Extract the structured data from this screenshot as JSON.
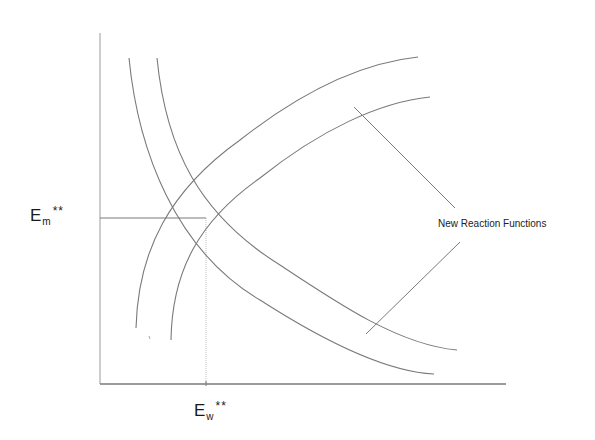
{
  "diagram": {
    "type": "reaction-function-shift",
    "colors": {
      "line": "#7a7a7a",
      "axis": "#8a8a8a",
      "guide": "#9a9a9a",
      "text": "#1a1a1a",
      "background": "#ffffff"
    },
    "labels": {
      "y_equilibrium": {
        "base": "E",
        "subscript": "m",
        "superscript": "**"
      },
      "x_equilibrium": {
        "base": "E",
        "subscript": "w",
        "superscript": "**"
      },
      "annotation": "New Reaction Functions"
    },
    "axes": {
      "origin": [
        100,
        384
      ],
      "y_axis_top": [
        100,
        33
      ],
      "x_axis_right": [
        506,
        384
      ]
    },
    "equilibrium_point": [
      206,
      218
    ],
    "curves": [
      {
        "name": "falling-reaction-function-outer",
        "path": "M129,58 C138,150 175,250 260,300 C330,345 390,372 434,374"
      },
      {
        "name": "falling-reaction-function-new",
        "path": "M157,58 C166,150 200,215 280,265 C340,305 400,345 457,350"
      },
      {
        "name": "rising-reaction-function-outer",
        "path": "M136,328 C138,250 170,190 240,140 C310,85 370,62 418,57"
      },
      {
        "name": "rising-reaction-function-new",
        "path": "M171,340 C172,270 200,220 260,178 C320,130 380,102 430,97"
      }
    ],
    "pointers": [
      {
        "name": "pointer-line-upper",
        "from": [
          354,
          107
        ],
        "to": [
          455,
          208
        ]
      },
      {
        "name": "pointer-line-lower",
        "from": [
          366,
          334
        ],
        "to": [
          460,
          242
        ]
      }
    ]
  }
}
